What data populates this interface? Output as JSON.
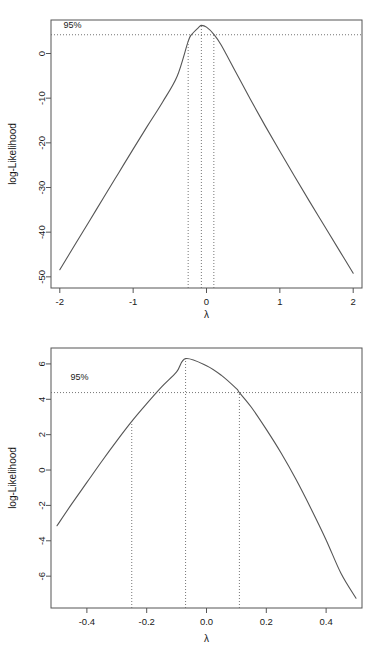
{
  "figure": {
    "kind": "box-cox-log-likelihood-profile",
    "panel_count": 2
  },
  "panels": [
    {
      "id": "top",
      "name": "boxcox-full-range",
      "x_axis": {
        "label": "λ",
        "ticks": [
          "-2",
          "-1",
          "0",
          "1",
          "2"
        ],
        "tick_values": [
          -2,
          -1,
          0,
          1,
          2
        ],
        "range": [
          -2.12,
          2.12
        ]
      },
      "y_axis": {
        "label": "log-Likelihood",
        "ticks": [
          "0",
          "-10",
          "-20",
          "-30",
          "-40",
          "-50"
        ],
        "tick_values": [
          0,
          -10,
          -20,
          -30,
          -40,
          -50
        ],
        "range": [
          -52.5,
          7.5
        ]
      },
      "ci_label": "95%",
      "ci_level_y": 4.2,
      "mle_lambda": -0.07,
      "ci_lower_lambda": -0.25,
      "ci_upper_lambda": 0.1,
      "peak_loglik": 6.3
    },
    {
      "id": "bottom",
      "name": "boxcox-zoomed-range",
      "x_axis": {
        "label": "λ",
        "ticks": [
          "-0.4",
          "-0.2",
          "0.0",
          "0.2",
          "0.4"
        ],
        "tick_values": [
          -0.4,
          -0.2,
          0.0,
          0.2,
          0.4
        ],
        "range": [
          -0.52,
          0.52
        ]
      },
      "y_axis": {
        "label": "log-Likelihood",
        "ticks": [
          "6",
          "4",
          "2",
          "0",
          "-2",
          "-4",
          "-6"
        ],
        "tick_values": [
          6,
          4,
          2,
          0,
          -2,
          -4,
          -6
        ],
        "range": [
          -7.8,
          6.9
        ]
      },
      "ci_label": "95%",
      "ci_level_y": 4.38,
      "mle_lambda": -0.07,
      "ci_lower_lambda": -0.25,
      "ci_upper_lambda": 0.11,
      "peak_loglik": 6.3
    }
  ],
  "chart_data": [
    {
      "type": "line",
      "title": "",
      "xlabel": "λ",
      "ylabel": "log-Likelihood",
      "xlim": [
        -2.12,
        2.12
      ],
      "ylim": [
        -52.5,
        7.5
      ],
      "grid": false,
      "legend": null,
      "annotations": [
        {
          "text": "95%",
          "x": -1.95,
          "y": 5.6,
          "kind": "ci-label"
        }
      ],
      "reference_lines": [
        {
          "orientation": "horizontal",
          "value": 4.2,
          "style": "dotted"
        },
        {
          "orientation": "vertical",
          "value": -0.25,
          "style": "dotted"
        },
        {
          "orientation": "vertical",
          "value": -0.07,
          "style": "dotted"
        },
        {
          "orientation": "vertical",
          "value": 0.1,
          "style": "dotted"
        }
      ],
      "x": [
        -2.0,
        -1.8,
        -1.6,
        -1.4,
        -1.2,
        -1.0,
        -0.8,
        -0.6,
        -0.4,
        -0.25,
        -0.2,
        -0.1,
        -0.07,
        0.0,
        0.1,
        0.2,
        0.4,
        0.6,
        0.8,
        1.0,
        1.2,
        1.4,
        1.6,
        1.8,
        2.0
      ],
      "y": [
        -48.4,
        -43.0,
        -37.6,
        -32.2,
        -26.8,
        -21.4,
        -16.1,
        -10.9,
        -5.1,
        2.7,
        4.3,
        5.95,
        6.3,
        5.9,
        4.3,
        1.9,
        -4.2,
        -10.3,
        -16.2,
        -21.9,
        -27.5,
        -33.0,
        -38.4,
        -43.8,
        -49.2
      ]
    },
    {
      "type": "line",
      "title": "",
      "xlabel": "λ",
      "ylabel": "log-Likelihood",
      "xlim": [
        -0.52,
        0.52
      ],
      "ylim": [
        -7.8,
        6.9
      ],
      "grid": false,
      "legend": null,
      "annotations": [
        {
          "text": "95%",
          "x": -0.455,
          "y": 5.1,
          "kind": "ci-label"
        }
      ],
      "reference_lines": [
        {
          "orientation": "horizontal",
          "value": 4.38,
          "style": "dotted"
        },
        {
          "orientation": "vertical",
          "value": -0.25,
          "style": "dotted"
        },
        {
          "orientation": "vertical",
          "value": -0.07,
          "style": "dotted"
        },
        {
          "orientation": "vertical",
          "value": 0.11,
          "style": "dotted"
        }
      ],
      "x": [
        -0.5,
        -0.45,
        -0.4,
        -0.35,
        -0.3,
        -0.25,
        -0.2,
        -0.15,
        -0.1,
        -0.07,
        0.0,
        0.05,
        0.1,
        0.11,
        0.15,
        0.2,
        0.25,
        0.3,
        0.35,
        0.4,
        0.45,
        0.5
      ],
      "y": [
        -3.15,
        -1.9,
        -0.7,
        0.5,
        1.65,
        2.75,
        3.75,
        4.7,
        5.55,
        6.3,
        5.9,
        5.35,
        4.6,
        4.38,
        3.55,
        2.3,
        0.95,
        -0.55,
        -2.2,
        -3.95,
        -5.85,
        -7.25
      ]
    }
  ]
}
